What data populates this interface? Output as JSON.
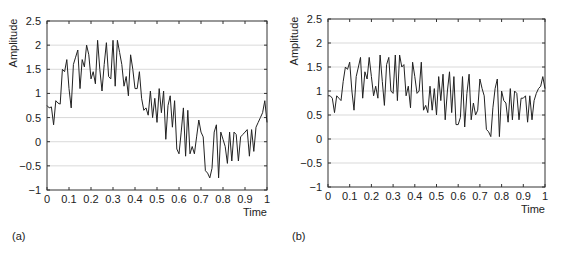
{
  "chart_data": [
    {
      "id": "a",
      "type": "line",
      "panel_label": "(a)",
      "title": "",
      "xlabel": "Time",
      "ylabel": "Amplitude",
      "xlim": [
        0,
        1
      ],
      "ylim": [
        -1,
        2.5
      ],
      "grid": "horizontal",
      "x_ticks": [
        "0",
        "0.1",
        "0.2",
        "0.3",
        "0.4",
        "0.5",
        "0.6",
        "0.7",
        "0.8",
        "0.9",
        "1"
      ],
      "y_ticks": [
        "-1",
        "-0.5",
        "0",
        "0.5",
        "1",
        "1.5",
        "2",
        "2.5"
      ],
      "y_tick_values": [
        -1,
        -0.5,
        0,
        0.5,
        1,
        1.5,
        2,
        2.5
      ],
      "x_tick_values": [
        0,
        0.1,
        0.2,
        0.3,
        0.4,
        0.5,
        0.6,
        0.7,
        0.8,
        0.9,
        1
      ],
      "series": [
        {
          "name": "noisy signal",
          "x": [
            0,
            0.01,
            0.02,
            0.03,
            0.04,
            0.05,
            0.06,
            0.07,
            0.08,
            0.09,
            0.1,
            0.11,
            0.12,
            0.13,
            0.14,
            0.15,
            0.16,
            0.17,
            0.18,
            0.19,
            0.2,
            0.21,
            0.22,
            0.23,
            0.24,
            0.25,
            0.26,
            0.27,
            0.28,
            0.29,
            0.3,
            0.31,
            0.32,
            0.33,
            0.34,
            0.35,
            0.36,
            0.37,
            0.38,
            0.39,
            0.4,
            0.41,
            0.42,
            0.43,
            0.44,
            0.45,
            0.46,
            0.47,
            0.48,
            0.49,
            0.5,
            0.51,
            0.52,
            0.53,
            0.54,
            0.55,
            0.56,
            0.57,
            0.58,
            0.59,
            0.6,
            0.61,
            0.62,
            0.63,
            0.64,
            0.65,
            0.66,
            0.67,
            0.68,
            0.69,
            0.7,
            0.71,
            0.72,
            0.73,
            0.74,
            0.75,
            0.76,
            0.77,
            0.78,
            0.79,
            0.8,
            0.81,
            0.82,
            0.83,
            0.84,
            0.85,
            0.86,
            0.87,
            0.88,
            0.89,
            0.9,
            0.91,
            0.92,
            0.93,
            0.94,
            0.95,
            0.96,
            0.97,
            0.98,
            0.99,
            1.0
          ],
          "y": [
            0.75,
            0.7,
            0.72,
            0.35,
            0.85,
            0.8,
            0.78,
            1.5,
            1.45,
            1.7,
            1.1,
            0.7,
            1.6,
            1.75,
            1.9,
            1.1,
            1.7,
            1.55,
            2.0,
            1.8,
            1.3,
            1.45,
            1.2,
            2.1,
            1.5,
            1.05,
            1.6,
            2.05,
            1.35,
            1.3,
            2.1,
            1.15,
            2.1,
            1.85,
            1.6,
            1.15,
            1.35,
            0.95,
            1.8,
            1.5,
            1.1,
            1.1,
            1.45,
            0.9,
            0.65,
            0.7,
            0.55,
            1.05,
            0.5,
            0.9,
            0.4,
            1.1,
            0.6,
            1.05,
            0.05,
            0.75,
            0.95,
            0.3,
            0.85,
            -0.15,
            -0.25,
            0.2,
            0.7,
            -0.3,
            0.65,
            -0.25,
            -0.1,
            -0.25,
            0.1,
            0.45,
            0.2,
            0.1,
            -0.6,
            -0.65,
            -0.75,
            -0.55,
            0.2,
            0.35,
            -0.75,
            0.2,
            0.05,
            -0.1,
            -0.45,
            0.2,
            -0.4,
            0.2,
            0.15,
            -0.4,
            0.1,
            0.15,
            0.2,
            0.25,
            -0.3,
            0.25,
            -0.2,
            0.3,
            0.4,
            0.5,
            0.6,
            0.85,
            0.4
          ]
        }
      ]
    },
    {
      "id": "b",
      "type": "line",
      "panel_label": "(b)",
      "title": "",
      "xlabel": "Time",
      "ylabel": "Amplitude",
      "xlim": [
        0,
        1
      ],
      "ylim": [
        -1,
        2.5
      ],
      "grid": "horizontal",
      "x_ticks": [
        "0",
        "0.1",
        "0.2",
        "0.3",
        "0.4",
        "0.5",
        "0.6",
        "0.7",
        "0.8",
        "0.9",
        "1"
      ],
      "y_ticks": [
        "-1",
        "-0.5",
        "0",
        "0.5",
        "1",
        "1.5",
        "2",
        "2.5"
      ],
      "y_tick_values": [
        -1,
        -0.5,
        0,
        0.5,
        1,
        1.5,
        2,
        2.5
      ],
      "x_tick_values": [
        0,
        0.1,
        0.2,
        0.3,
        0.4,
        0.5,
        0.6,
        0.7,
        0.8,
        0.9,
        1
      ],
      "series": [
        {
          "name": "noisy signal",
          "x": [
            0,
            0.01,
            0.02,
            0.03,
            0.04,
            0.05,
            0.06,
            0.07,
            0.08,
            0.09,
            0.1,
            0.11,
            0.12,
            0.13,
            0.14,
            0.15,
            0.16,
            0.17,
            0.18,
            0.19,
            0.2,
            0.21,
            0.22,
            0.23,
            0.24,
            0.25,
            0.26,
            0.27,
            0.28,
            0.29,
            0.3,
            0.31,
            0.32,
            0.33,
            0.34,
            0.35,
            0.36,
            0.37,
            0.38,
            0.39,
            0.4,
            0.41,
            0.42,
            0.43,
            0.44,
            0.45,
            0.46,
            0.47,
            0.48,
            0.49,
            0.5,
            0.51,
            0.52,
            0.53,
            0.54,
            0.55,
            0.56,
            0.57,
            0.58,
            0.59,
            0.6,
            0.61,
            0.62,
            0.63,
            0.64,
            0.65,
            0.66,
            0.67,
            0.68,
            0.69,
            0.7,
            0.71,
            0.72,
            0.73,
            0.74,
            0.75,
            0.76,
            0.77,
            0.78,
            0.79,
            0.8,
            0.81,
            0.82,
            0.83,
            0.84,
            0.85,
            0.86,
            0.87,
            0.88,
            0.89,
            0.9,
            0.91,
            0.92,
            0.93,
            0.94,
            0.95,
            0.96,
            0.97,
            0.98,
            0.99,
            1.0
          ],
          "y": [
            0.9,
            0.9,
            0.85,
            0.55,
            0.9,
            0.85,
            0.8,
            1.2,
            1.5,
            1.45,
            1.6,
            1.0,
            0.6,
            1.3,
            1.5,
            1.7,
            0.85,
            1.4,
            1.25,
            1.7,
            1.3,
            0.9,
            1.1,
            0.85,
            1.75,
            1.2,
            0.7,
            1.55,
            1.7,
            1.0,
            0.95,
            1.75,
            0.8,
            1.75,
            1.5,
            1.55,
            0.9,
            1.1,
            0.65,
            1.6,
            1.3,
            0.95,
            1.0,
            1.6,
            0.6,
            0.7,
            0.55,
            1.1,
            0.6,
            1.05,
            0.5,
            1.3,
            0.8,
            1.35,
            0.4,
            1.0,
            1.4,
            0.55,
            1.3,
            0.3,
            0.3,
            0.45,
            1.3,
            0.25,
            0.95,
            1.35,
            0.4,
            0.75,
            0.5,
            0.6,
            1.25,
            1.05,
            0.9,
            0.2,
            0.15,
            0.05,
            0.65,
            1.05,
            1.25,
            0.05,
            1.0,
            0.8,
            0.75,
            0.35,
            1.05,
            0.4,
            1.0,
            0.95,
            0.4,
            0.85,
            0.85,
            0.9,
            0.35,
            0.9,
            0.4,
            0.8,
            0.95,
            1.05,
            1.1,
            1.3,
            1.05
          ]
        }
      ]
    }
  ],
  "panels": {
    "a": {
      "label": "(a)",
      "xlabel": "Time",
      "ylabel": "Amplitude"
    },
    "b": {
      "label": "(b)",
      "xlabel": "Time",
      "ylabel": "Amplitude"
    }
  },
  "colors": {
    "line": "#222222",
    "axis": "#333333",
    "grid": "#cfcfcf",
    "background": "#ffffff"
  }
}
